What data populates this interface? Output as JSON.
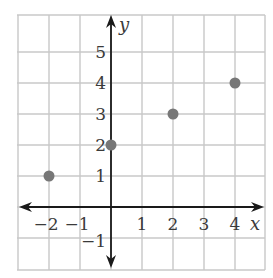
{
  "chart_data": {
    "type": "scatter",
    "title": "",
    "xlabel": "x",
    "ylabel": "y",
    "xlim": [
      -3,
      5
    ],
    "ylim": [
      -2,
      6
    ],
    "grid": true,
    "legend": null,
    "x_tick_labels": [
      "−2",
      "−1",
      "1",
      "2",
      "3",
      "4"
    ],
    "x_tick_values": [
      -2,
      -1,
      1,
      2,
      3,
      4
    ],
    "y_tick_labels": [
      "−1",
      "1",
      "2",
      "3",
      "4",
      "5"
    ],
    "y_tick_values": [
      -1,
      1,
      2,
      3,
      4,
      5
    ],
    "series": [
      {
        "name": "points",
        "points": [
          {
            "x": -2,
            "y": 1
          },
          {
            "x": 0,
            "y": 2
          },
          {
            "x": 2,
            "y": 3
          },
          {
            "x": 4,
            "y": 4
          }
        ]
      }
    ]
  },
  "style": {
    "grid_color": "#c8c8c8",
    "axis_color": "#1a1a1a",
    "point_color": "#777777",
    "text_color": "#3a3a3a"
  },
  "layout": {
    "origin_px": {
      "x": 111,
      "y": 207
    },
    "unit_px": 31,
    "plot_left": 17,
    "plot_right": 265,
    "plot_top": 15,
    "plot_bottom": 270
  }
}
